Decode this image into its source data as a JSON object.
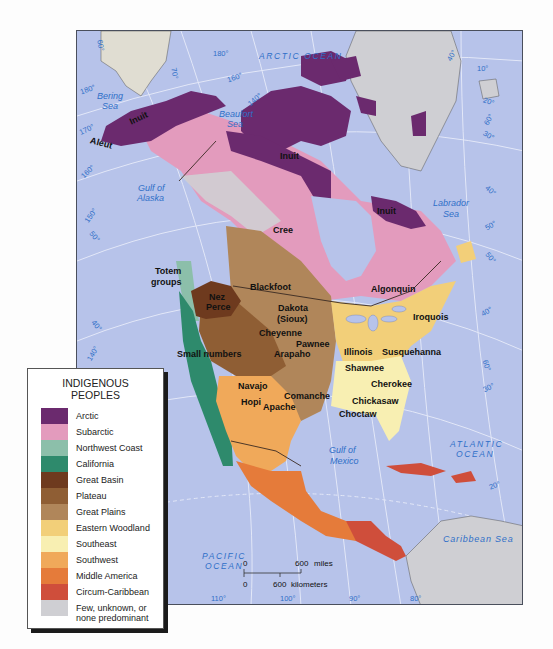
{
  "legend": {
    "title_line1": "INDIGENOUS",
    "title_line2": "PEOPLES",
    "items": [
      {
        "label": "Arctic",
        "color": "#6b2a6e"
      },
      {
        "label": "Subarctic",
        "color": "#e39bbd"
      },
      {
        "label": "Northwest Coast",
        "color": "#8cbfaa"
      },
      {
        "label": "California",
        "color": "#2e8a6c"
      },
      {
        "label": "Great Basin",
        "color": "#6e3a1e"
      },
      {
        "label": "Plateau",
        "color": "#8f5e34"
      },
      {
        "label": "Great Plains",
        "color": "#b0865a"
      },
      {
        "label": "Eastern Woodland",
        "color": "#f2cf79"
      },
      {
        "label": "Southeast",
        "color": "#f8efb2"
      },
      {
        "label": "Southwest",
        "color": "#f0a95a"
      },
      {
        "label": "Middle America",
        "color": "#e57b3a"
      },
      {
        "label": "Circum-Caribbean",
        "color": "#cf4e3b"
      },
      {
        "label": "Few, unknown, or none predominant",
        "color": "#cfcfd3"
      }
    ]
  },
  "map": {
    "water_color": "#b7c3ea",
    "oceans": {
      "arctic": "ARCTIC OCEAN",
      "atlantic_1": "ATLANTIC",
      "atlantic_2": "OCEAN",
      "pacific_1": "PACIFIC",
      "pacific_2": "OCEAN"
    },
    "seas": {
      "bering_1": "Bering",
      "bering_2": "Sea",
      "beaufort_1": "Beaufort",
      "beaufort_2": "Sea",
      "alaska_1": "Gulf of",
      "alaska_2": "Alaska",
      "labrador_1": "Labrador",
      "labrador_2": "Sea",
      "mexico_1": "Gulf of",
      "mexico_2": "Mexico",
      "caribbean": "Caribbean Sea"
    },
    "peoples": {
      "inuit_alaska": "Inuit",
      "aleut": "Aleut",
      "inuit_arctic": "Inuit",
      "inuit_east": "Inuit",
      "cree": "Cree",
      "totem_1": "Totem",
      "totem_2": "groups",
      "blackfoot": "Blackfoot",
      "nez_1": "Nez",
      "nez_2": "Perce",
      "dakota_1": "Dakota",
      "dakota_2": "(Sioux)",
      "cheyenne": "Cheyenne",
      "pawnee": "Pawnee",
      "small_numbers": "Small numbers",
      "arapaho": "Arapaho",
      "algonquin": "Algonquin",
      "iroquois": "Iroquois",
      "illinois": "Illinois",
      "susquehanna": "Susquehanna",
      "shawnee": "Shawnee",
      "cherokee": "Cherokee",
      "chickasaw": "Chickasaw",
      "choctaw": "Choctaw",
      "navajo": "Navajo",
      "hopi": "Hopi",
      "comanche": "Comanche",
      "apache": "Apache"
    },
    "degrees": {
      "d60_top": "60°",
      "d180a": "180°",
      "d70": "70°",
      "d180b": "180°",
      "d160": "160°",
      "d140": "140°",
      "d170": "170°",
      "d160_left": "160°",
      "d50_left": "50°",
      "d150": "150°",
      "d40_left": "40°",
      "d140_left": "140°",
      "d40_top": "40°",
      "d10": "10°",
      "d20": "20°",
      "d60_right": "60°",
      "d30_right": "30°",
      "d40_right": "40°",
      "d50_right": "50°",
      "d50b_right": "50°",
      "d40b_right": "40°",
      "d60b_right": "60°",
      "d30b_right": "30°",
      "d20_right": "20°",
      "d110": "110°",
      "d100": "100°",
      "d90": "90°",
      "d80": "80°"
    },
    "scale": {
      "miles_zero": "0",
      "miles_value": "600",
      "miles_unit": "miles",
      "km_zero": "0",
      "km_value": "600",
      "km_unit": "kilometers"
    }
  }
}
